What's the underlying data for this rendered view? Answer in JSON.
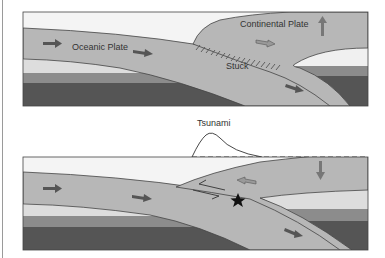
{
  "diagram": {
    "panels": [
      {
        "id": "before",
        "labels": {
          "oceanic_plate": "Oceanic Plate",
          "continental_plate": "Continental Plate",
          "stuck": "Stuck"
        },
        "arrows": [
          "oceanic-plate-right-arrow",
          "oceanic-plate-right-arrow-2",
          "continental-plate-push-arrow",
          "uplift-arrow",
          "subducting-slab-arrow"
        ]
      },
      {
        "id": "after",
        "labels": {
          "tsunami": "Tsunami"
        },
        "arrows": [
          "oceanic-plate-right-arrow",
          "oceanic-plate-right-arrow-2",
          "rebound-left-arrow",
          "subsidence-down-arrow",
          "subducting-slab-arrow",
          "fault-slip-arrows"
        ],
        "markers": [
          "earthquake-epicenter-star"
        ]
      }
    ],
    "colors": {
      "water": "#f4f4f4",
      "plate": "#b7b7b7",
      "asthenosphere_light": "#dddddd",
      "mantle_mid": "#8c8c8c",
      "mantle_dark": "#555555",
      "outline": "#444444",
      "arrow": "#6b6b6b",
      "star": "#111111"
    }
  }
}
